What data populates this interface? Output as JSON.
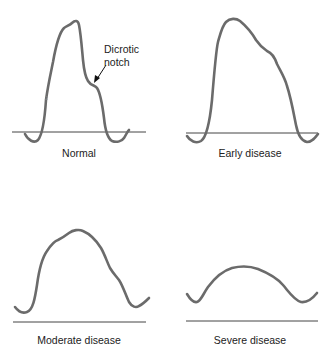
{
  "figure": {
    "type": "pulse-volume-waveforms",
    "line_color": "#6b6b6b",
    "baseline_color": "#444444",
    "text_color": "#222222"
  },
  "panels": [
    {
      "id": "normal",
      "label": "Normal",
      "annotation": {
        "line1": "Dicrotic",
        "line2": "notch"
      },
      "small_mark": "2"
    },
    {
      "id": "early",
      "label": "Early disease"
    },
    {
      "id": "moderate",
      "label": "Moderate disease"
    },
    {
      "id": "severe",
      "label": "Severe disease"
    }
  ]
}
